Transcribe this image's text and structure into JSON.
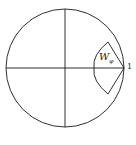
{
  "figure": {
    "type": "unit-disk-diagram",
    "circle": {
      "cx": 65,
      "cy": 68,
      "r": 59
    },
    "axes": {
      "horizontal": true,
      "vertical": true
    },
    "region": {
      "label_main": "W",
      "label_sub": "φ",
      "vertex_point": [
        124,
        68
      ],
      "upper_corner": [
        108,
        42
      ],
      "lower_corner": [
        108,
        94
      ],
      "inner_arc_leftmost_x": 94
    },
    "point_label": "1",
    "stroke_color": "#1a1a1a"
  }
}
